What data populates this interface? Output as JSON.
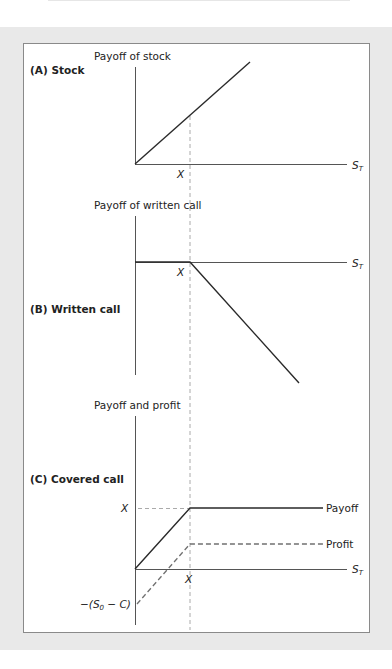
{
  "figure": {
    "panels": [
      {
        "id": "A",
        "title": "(A) Stock",
        "y_axis_label": "Payoff of stock",
        "x_axis_label": "S",
        "x_axis_sub": "T",
        "strike_label": "X"
      },
      {
        "id": "B",
        "title": "(B) Written call",
        "y_axis_label": "Payoff of written call",
        "x_axis_label": "S",
        "x_axis_sub": "T",
        "strike_label": "X"
      },
      {
        "id": "C",
        "title": "(C) Covered call",
        "y_axis_label": "Payoff and profit",
        "x_axis_label": "S",
        "x_axis_sub": "T",
        "strike_label": "X",
        "y_strike_label": "X",
        "y_intercept_label_pre": "−(S",
        "y_intercept_label_sub": "0",
        "y_intercept_label_post": " − C)",
        "payoff_label": "Payoff",
        "profit_label": "Profit"
      }
    ],
    "colors": {
      "line": "#2a2a2a",
      "dashed": "#9a9a9a",
      "profit_dashed": "#707070",
      "background": "#e9e9e9",
      "frame": "#8a8a8a"
    }
  }
}
